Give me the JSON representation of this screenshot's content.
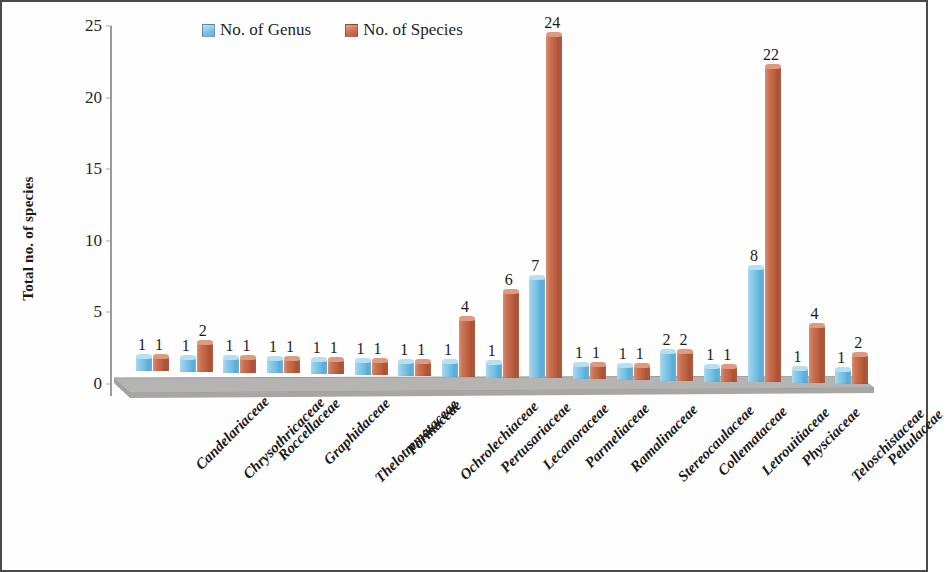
{
  "chart_data": {
    "type": "bar",
    "title": "",
    "xlabel": "",
    "ylabel": "Total no. of species",
    "ylim": [
      0,
      25
    ],
    "ytick_values": [
      0,
      5,
      10,
      15,
      20,
      25
    ],
    "grid": false,
    "legend_position": "top-center",
    "categories": [
      "Candelariaceae",
      "Chrysothricaceae",
      "Roccellaceae",
      "Graphidaceae",
      "Thelotremataceae",
      "Porinaceae",
      "Ochrolechiaceae",
      "Pertusariaceae",
      "Lecanoraceae",
      "Parmeliaceae",
      "Ramalinaceae",
      "Stereocaulaceae",
      "Collemataceae",
      "Letrouitiaceae",
      "Physciaceae",
      "Teloschistaceae",
      "Peltulaceae"
    ],
    "series": [
      {
        "name": "No. of Genus",
        "color": "#7FC4E8",
        "values": [
          1,
          1,
          1,
          1,
          1,
          1,
          1,
          1,
          1,
          7,
          1,
          1,
          2,
          1,
          8,
          1,
          1
        ]
      },
      {
        "name": "No. of Species",
        "color": "#C8684A",
        "values": [
          1,
          2,
          1,
          1,
          1,
          1,
          1,
          4,
          6,
          24,
          1,
          1,
          2,
          1,
          22,
          4,
          2
        ]
      }
    ]
  },
  "axis": {
    "y_title": "Total no. of species"
  },
  "legend": {
    "items": [
      {
        "label": "No. of Genus",
        "swatch": "genus-swatch-icon"
      },
      {
        "label": "No. of Species",
        "swatch": "species-swatch-icon"
      }
    ]
  }
}
